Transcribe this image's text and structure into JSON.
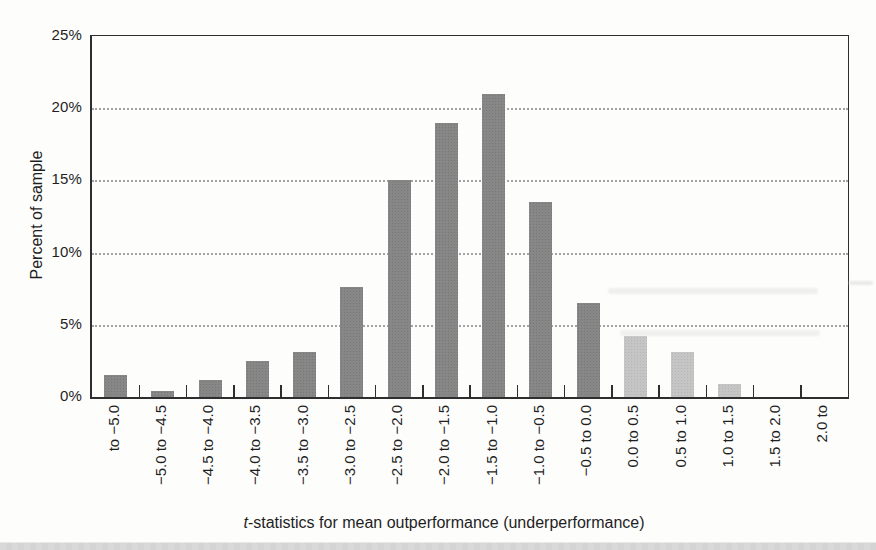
{
  "page": {
    "background": "#fdfdfc",
    "bottom_strip_color": "#d9d9d9"
  },
  "chart_data": {
    "type": "bar",
    "title": "",
    "ylabel": "Percent of sample",
    "xlabel": "t-statistics for mean outperformance (underperformance)",
    "xlabel_italic_prefix": "t",
    "xlabel_rest": "-statistics for mean outperformance (underperformance)",
    "ylim": [
      0,
      25
    ],
    "y_tick_values": [
      0,
      5,
      10,
      15,
      20,
      25
    ],
    "y_tick_labels": [
      "0%",
      "5%",
      "10%",
      "15%",
      "20%",
      "25%"
    ],
    "gridline_values": [
      5,
      10,
      15,
      20
    ],
    "gridline_style": "dotted",
    "legend_position": "none",
    "categories": [
      "to −5.0",
      "−5.0 to −4.5",
      "−4.5 to −4.0",
      "−4.0 to −3.5",
      "−3.5 to −3.0",
      "−3.0 to −2.5",
      "−2.5 to −2.0",
      "−2.0 to −1.5",
      "−1.5 to −1.0",
      "−1.0 to −0.5",
      "−0.5 to 0.0",
      "0.0 to 0.5",
      "0.5 to 1.0",
      "1.0 to 1.5",
      "1.5 to 2.0",
      "2.0 to"
    ],
    "values": [
      1.5,
      0.4,
      1.2,
      2.5,
      3.1,
      7.6,
      15.0,
      19.0,
      21.0,
      13.5,
      6.5,
      4.2,
      3.1,
      0.9,
      0,
      0
    ],
    "bar_shades": [
      "dark",
      "dark",
      "dark",
      "dark",
      "dark",
      "dark",
      "dark",
      "dark",
      "dark",
      "dark",
      "dark",
      "light",
      "light",
      "light",
      "light",
      "light"
    ],
    "colors": {
      "bar_dark": "#878787",
      "bar_light": "#c5c5c5",
      "axis": "#2e2e2e",
      "grid": "#a3a3a3",
      "text": "#1f1f1f"
    }
  }
}
